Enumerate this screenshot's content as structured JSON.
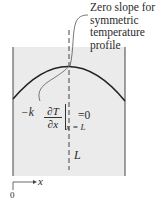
{
  "annotation": {
    "lines": [
      "Zero slope for",
      "symmetric",
      "temperature",
      "profile"
    ]
  },
  "equation": {
    "prefix": "−k",
    "numerator": "∂T",
    "denominator": "∂x",
    "equals": "=0",
    "subscript": "x = L"
  },
  "labels": {
    "length": "L",
    "axis_x": "x",
    "origin": "0"
  },
  "colors": {
    "region_fill": "#ebebeb",
    "lines": "#333333"
  }
}
